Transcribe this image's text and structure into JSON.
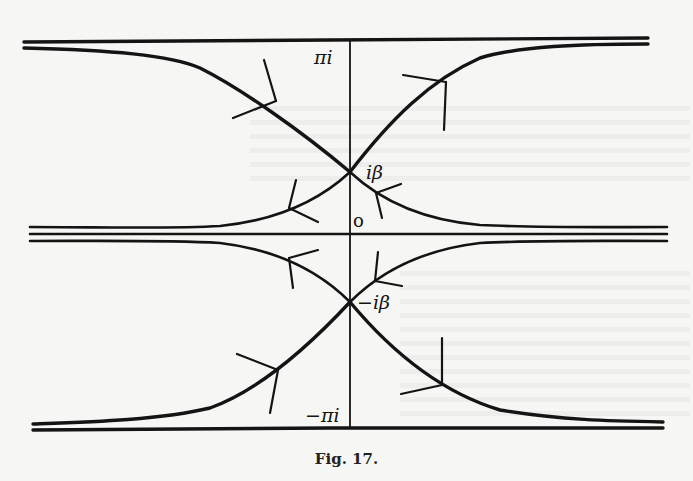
{
  "figure": {
    "caption": "Fig. 17.",
    "labels": {
      "top": "πi",
      "upper_saddle": "iβ",
      "origin": "o",
      "lower_saddle": "−iβ",
      "bottom": "−πi"
    },
    "colors": {
      "ink": "#141414",
      "paper": "#f6f6f4"
    }
  },
  "diagram": {
    "type": "complex-plane steepest-descent contour diagram",
    "axis": {
      "x": 350,
      "y_top": 40,
      "y_bottom": 428
    },
    "horizontal_lines": [
      {
        "name": "line-pi-i",
        "y": 40,
        "x_from": 24,
        "x_to": 648
      },
      {
        "name": "real-axis",
        "y": 234,
        "x_from": 30,
        "x_to": 667
      },
      {
        "name": "line-minus-pi-i",
        "y": 428,
        "x_from": 33,
        "x_to": 663
      }
    ],
    "saddle_points": [
      {
        "label": "iβ",
        "x": 350,
        "y": 172
      },
      {
        "label": "−iβ",
        "x": 350,
        "y": 302
      }
    ]
  }
}
